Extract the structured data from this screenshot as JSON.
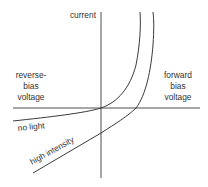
{
  "diagram": {
    "axes": {
      "y_label": "current",
      "x_left_label": [
        "reverse-",
        "bias",
        "voltage"
      ],
      "x_right_label": [
        "forward",
        "bias",
        "voltage"
      ]
    },
    "curves": [
      {
        "name": "no light",
        "label": "no light"
      },
      {
        "name": "high intensity",
        "label": "high intensity"
      }
    ],
    "colors": {
      "line": "#3a3a3a",
      "text": "#333333",
      "background": "#ffffff"
    }
  }
}
